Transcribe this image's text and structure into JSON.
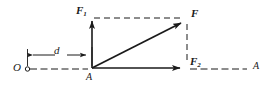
{
  "figure": {
    "type": "force-resultant-vector-diagram",
    "background_color": "#ffffff",
    "stroke_color": "#1a1a1a",
    "labels": {
      "vertical_force": "F",
      "vertical_force_subscript": "1",
      "resultant_force": "F",
      "horizontal_force": "F",
      "horizontal_force_subscript": "2",
      "origin_point": "O",
      "application_point": "A",
      "axis_end": "A",
      "distance": "d"
    },
    "geometry": {
      "origin_point": {
        "x": 28,
        "y": 69
      },
      "application_point": {
        "x": 92,
        "y": 68
      },
      "vertical_arrow_tip": {
        "x": 92,
        "y": 17
      },
      "horizontal_arrow_tip": {
        "x": 186,
        "y": 68
      },
      "resultant_arrow_tip": {
        "x": 186,
        "y": 18
      },
      "axis_right_end": {
        "x": 248,
        "y": 69
      },
      "dimension_line_y": 55,
      "dimension_from_x": 27,
      "dimension_to_x": 92
    }
  }
}
